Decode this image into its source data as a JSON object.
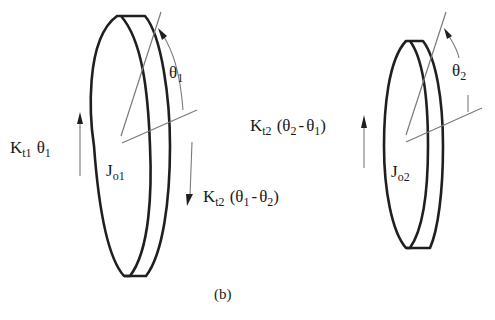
{
  "figure": {
    "caption": "(b)",
    "stroke_color": "#1f1f1f",
    "thin_color": "#7a7a7a"
  },
  "disk1": {
    "inertia": {
      "symbol": "J",
      "subscript": "o1"
    },
    "angle": {
      "symbol": "θ",
      "subscript": "1"
    },
    "left_torque": {
      "symbol": "K",
      "k_sub": "t1",
      "theta": "θ",
      "theta_sub": "1",
      "direction": "up"
    },
    "right_torque": {
      "symbol": "K",
      "k_sub": "t2",
      "open": "(",
      "a": "θ",
      "a_sub": "1",
      "minus": "-",
      "b": "θ",
      "b_sub": "2",
      "close": ")",
      "direction": "down"
    }
  },
  "disk2": {
    "inertia": {
      "symbol": "J",
      "subscript": "o2"
    },
    "angle": {
      "symbol": "θ",
      "subscript": "2"
    },
    "left_torque": {
      "symbol": "K",
      "k_sub": "t2",
      "open": "(",
      "a": "θ",
      "a_sub": "2",
      "minus": "-",
      "b": "θ",
      "b_sub": "1",
      "close": ")",
      "direction": "up"
    }
  }
}
